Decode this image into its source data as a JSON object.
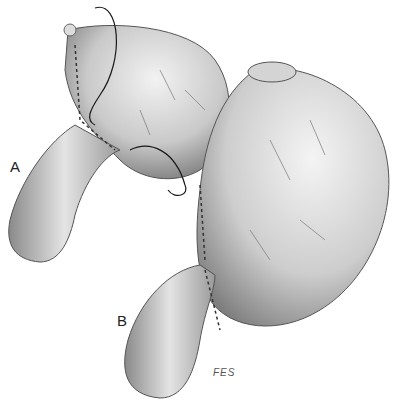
{
  "figure": {
    "labels": {
      "a": "A",
      "b": "B"
    },
    "signature": "FES",
    "colors": {
      "background": "#ffffff",
      "tissue_light": "#e8e8e8",
      "tissue_mid": "#b8b8b8",
      "tissue_dark": "#6a6a6a",
      "suture": "#1a1a1a"
    }
  }
}
